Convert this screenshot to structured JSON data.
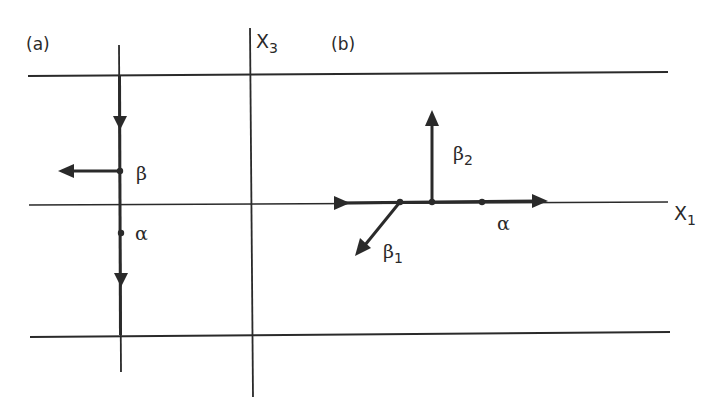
{
  "figure": {
    "panel_a_label": "(a)",
    "panel_b_label": "(b)",
    "axis_x3": {
      "main": "X",
      "sub": "3"
    },
    "axis_x1": {
      "main": "X",
      "sub": "1"
    }
  },
  "panel_a": {
    "beta_label": "β",
    "alpha_label": "α"
  },
  "panel_b": {
    "beta1": {
      "main": "β",
      "sub": "1"
    },
    "beta2": {
      "main": "β",
      "sub": "2"
    },
    "alpha_label": "α"
  },
  "colors": {
    "line": "#2a2a2a",
    "background": "#ffffff"
  }
}
